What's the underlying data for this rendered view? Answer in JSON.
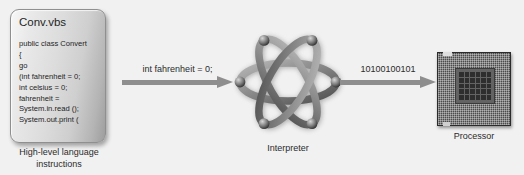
{
  "diagram": {
    "background_color": "#f1f1f1",
    "arrow_color": "#8e8e8e"
  },
  "code_card": {
    "filename": "Conv.vbs",
    "lines": [
      "public class Convert",
      "{",
      "go",
      "(int fahrenheit = 0;",
      "int celsius = 0;",
      "fahrenheit =",
      "System.in.read ();",
      "System.out.print ("
    ],
    "caption": "High-level language instructions"
  },
  "arrows": [
    {
      "label": "int fahrenheit = 0;",
      "name": "arrow-source-to-interpreter"
    },
    {
      "label": "10100100101",
      "name": "arrow-interpreter-to-processor"
    }
  ],
  "interpreter": {
    "caption": "Interpreter",
    "icon": "atom-icon"
  },
  "processor": {
    "caption": "Processor",
    "icon": "cpu-chip-icon"
  }
}
